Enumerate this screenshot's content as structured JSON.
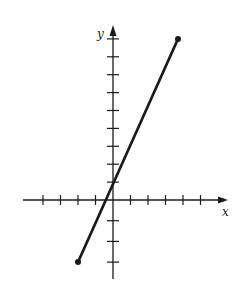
{
  "chart_data": {
    "type": "line",
    "title": "",
    "xlabel": "x",
    "ylabel": "y",
    "xlim": [
      -4,
      5
    ],
    "ylim": [
      -4,
      9
    ],
    "grid": false,
    "x_ticks_negative": [
      -4,
      -3,
      -2,
      -1
    ],
    "x_ticks_positive": [
      1,
      2,
      3,
      4,
      5
    ],
    "y_ticks_negative": [
      -3,
      -2,
      -1
    ],
    "y_ticks_positive": [
      1,
      2,
      3,
      4,
      5,
      6,
      7,
      8,
      9
    ],
    "series": [
      {
        "name": "segment",
        "equation": "y = 2x + 1",
        "x": [
          -2,
          4
        ],
        "y": [
          -3,
          9
        ],
        "endpoints": "closed dots"
      }
    ]
  },
  "labels": {
    "x_axis": "x",
    "y_axis": "y"
  },
  "colors": {
    "ink": "#1a1a1a",
    "background": "#ffffff"
  }
}
